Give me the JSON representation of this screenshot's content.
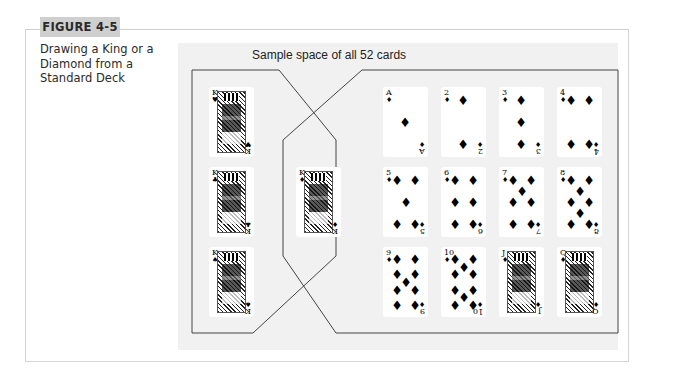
{
  "figure": {
    "label": "FIGURE 4-5",
    "caption_lines": [
      "Drawing a King or a",
      "Diamond from a",
      "Standard Deck"
    ]
  },
  "diagram": {
    "sample_space_title": "Sample space of all 52 cards",
    "regions": {
      "kings_other_suits": [
        "K♥",
        "K♣",
        "K♠"
      ],
      "intersection_king_of_diamonds": [
        "K♦"
      ],
      "diamonds_non_king": [
        "A♦",
        "2♦",
        "3♦",
        "4♦",
        "5♦",
        "6♦",
        "7♦",
        "8♦",
        "9♦",
        "10♦",
        "J♦",
        "Q♦"
      ]
    },
    "cards": {
      "kh": {
        "rank": "K",
        "suit": "♥"
      },
      "kc": {
        "rank": "K",
        "suit": "♣"
      },
      "ks": {
        "rank": "K",
        "suit": "♠"
      },
      "kd": {
        "rank": "K",
        "suit": "♦"
      },
      "ad": {
        "rank": "A",
        "suit": "♦",
        "rank_bottom": "A"
      },
      "d2": {
        "rank": "2",
        "suit": "♦"
      },
      "d3": {
        "rank": "3",
        "suit": "♦"
      },
      "d4": {
        "rank": "4",
        "suit": "♦"
      },
      "d5": {
        "rank": "5",
        "suit": "♦"
      },
      "d6": {
        "rank": "6",
        "suit": "♦"
      },
      "d7": {
        "rank": "7",
        "suit": "♦"
      },
      "d8": {
        "rank": "8",
        "suit": "♦"
      },
      "d9": {
        "rank": "9",
        "suit": "♦"
      },
      "d10": {
        "rank": "10",
        "suit": "♦"
      },
      "jd": {
        "rank": "J",
        "suit": "♦"
      },
      "qd": {
        "rank": "Q",
        "suit": "♦"
      }
    },
    "colors": {
      "panel_bg": "#f1f1f1",
      "line": "#444444",
      "label_bg": "#cfcfcf"
    }
  }
}
